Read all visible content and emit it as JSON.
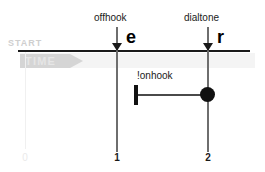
{
  "diagram": {
    "kind": "timing-diagram",
    "axis": {
      "start_label": "START",
      "time_label": "TIME",
      "ticks": [
        {
          "value": "0"
        },
        {
          "value": "1"
        },
        {
          "value": "2"
        }
      ]
    },
    "events": [
      {
        "label": "offhook",
        "letter": "e",
        "tick": "1"
      },
      {
        "label": "dialtone",
        "letter": "r",
        "tick": "2"
      }
    ],
    "condition": {
      "label": "!onhook",
      "from_tick": "1",
      "to_tick": "2"
    }
  },
  "colors": {
    "axis": "#1a1a1a",
    "lifeline": "#6e6e6e",
    "faint": "#eaeaea",
    "band": "#f4f4f4",
    "marker": "#111111"
  }
}
